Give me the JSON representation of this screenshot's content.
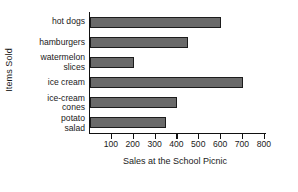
{
  "chart_data": {
    "type": "bar",
    "orientation": "horizontal",
    "title": "",
    "xlabel": "Sales at the School Picnic",
    "ylabel": "Items Sold",
    "categories": [
      "hot dogs",
      "hamburgers",
      "watermelon slices",
      "ice cream",
      "ice-cream cones",
      "potato salad"
    ],
    "category_lines": [
      [
        "hot dogs",
        ""
      ],
      [
        "hamburgers",
        ""
      ],
      [
        "watermelon",
        "slices"
      ],
      [
        "ice cream",
        ""
      ],
      [
        "ice-cream",
        "cones"
      ],
      [
        "potato",
        "salad"
      ]
    ],
    "values": [
      600,
      450,
      200,
      700,
      400,
      350
    ],
    "xlim": [
      0,
      810
    ],
    "xticks": [
      100,
      200,
      300,
      400,
      500,
      600,
      700,
      800
    ],
    "xtick_labels": [
      "100",
      "200",
      "300",
      "400",
      "500",
      "600",
      "700",
      "800"
    ],
    "grid": false,
    "legend": false,
    "bar_color": "#6a6a6a",
    "bar_border_color": "#1c1c1c",
    "axis_color": "#111111"
  }
}
